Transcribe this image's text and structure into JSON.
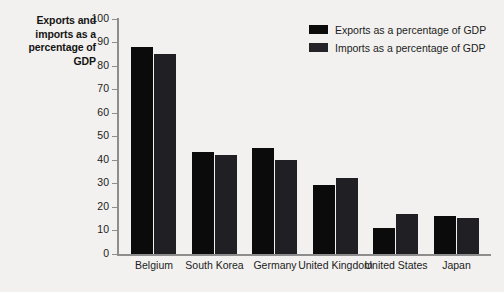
{
  "chart_data": {
    "type": "bar",
    "title": "",
    "xlabel": "",
    "ylabel": "Exports and imports as a percentage of GDP",
    "ylim": [
      0,
      100
    ],
    "ytick_step": 10,
    "yticks": [
      "100",
      "90",
      "80",
      "70",
      "60",
      "50",
      "40",
      "30",
      "20",
      "10",
      "0"
    ],
    "grid": false,
    "legend_position": "top-right",
    "categories": [
      "Belgium",
      "South Korea",
      "Germany",
      "United Kingdom",
      "United States",
      "Japan"
    ],
    "series": [
      {
        "name": "Exports as a percentage of GDP",
        "color": "#0b0b0c",
        "values": [
          88,
          43,
          45,
          29,
          11,
          16
        ]
      },
      {
        "name": "Imports as a percentage of GDP",
        "color": "#1f1f24",
        "values": [
          85,
          42,
          40,
          32,
          17,
          15
        ]
      }
    ]
  },
  "legend": {
    "items": [
      {
        "label": "Exports as a percentage of GDP",
        "swatch": "exports-swatch"
      },
      {
        "label": "Imports as a percentage of GDP",
        "swatch": "imports-swatch"
      }
    ]
  },
  "axis": {
    "y_title": "Exports and imports as a percentage of GDP"
  }
}
